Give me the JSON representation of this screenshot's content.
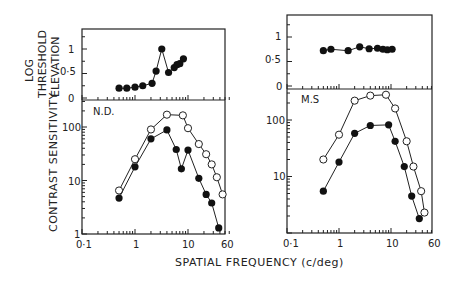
{
  "chart_data": [
    {
      "type": "line",
      "panel": "left-top",
      "subject": "N.D.",
      "ylabel": "LOG THRESHOLD ELEVATION",
      "yticks": [
        "0",
        "0·5",
        "1"
      ],
      "ylim": [
        0,
        1.3
      ],
      "xscale": "log",
      "xlim": [
        0.1,
        60
      ],
      "series": [
        {
          "name": "threshold elevation",
          "marker": "filled",
          "x": [
            0.5,
            0.7,
            1.0,
            1.4,
            2.1,
            2.5,
            3.2,
            4.3,
            5.5,
            6.2,
            7.0,
            8.2
          ],
          "y": [
            0.2,
            0.2,
            0.22,
            0.25,
            0.3,
            0.55,
            1.0,
            0.52,
            0.62,
            0.68,
            0.7,
            0.8
          ]
        }
      ]
    },
    {
      "type": "line",
      "panel": "left-bottom",
      "subject": "N.D.",
      "ylabel": "CONTRAST SENSITIVITY",
      "yscale": "log",
      "yticks": [
        "1",
        "10",
        "100"
      ],
      "ylim": [
        1,
        300
      ],
      "xscale": "log",
      "xticks": [
        "0·1",
        "1",
        "10",
        "60"
      ],
      "xlim": [
        0.1,
        60
      ],
      "series": [
        {
          "name": "open",
          "marker": "open",
          "x": [
            0.5,
            1,
            2,
            4,
            8,
            10,
            16,
            22,
            28,
            35,
            45
          ],
          "y": [
            6.5,
            25,
            90,
            170,
            165,
            95,
            48,
            31,
            20,
            11.5,
            5.5
          ]
        },
        {
          "name": "filled",
          "marker": "filled",
          "x": [
            0.5,
            1,
            2,
            4,
            6,
            7.5,
            10,
            16,
            22,
            28,
            38
          ],
          "y": [
            4.7,
            18,
            60,
            88,
            38,
            16.5,
            37,
            11,
            5.5,
            3.8,
            1.3
          ]
        }
      ]
    },
    {
      "type": "line",
      "panel": "right-top",
      "subject": "M.S",
      "yticks": [
        "0",
        "0·5",
        "1"
      ],
      "ylim": [
        0,
        1.3
      ],
      "xscale": "log",
      "xlim": [
        0.1,
        60
      ],
      "series": [
        {
          "name": "threshold elevation",
          "marker": "filled",
          "x": [
            0.5,
            0.7,
            1.5,
            2.5,
            3.8,
            5.5,
            7.0,
            8.5,
            10.5
          ],
          "y": [
            0.72,
            0.75,
            0.72,
            0.8,
            0.76,
            0.77,
            0.75,
            0.74,
            0.75
          ]
        }
      ]
    },
    {
      "type": "line",
      "panel": "right-bottom",
      "subject": "M.S",
      "yscale": "log",
      "yticks": [
        "10",
        "100"
      ],
      "ylim": [
        1,
        300
      ],
      "xscale": "log",
      "xticks": [
        "0·1",
        "1",
        "10",
        "60"
      ],
      "xlim": [
        0.1,
        60
      ],
      "series": [
        {
          "name": "open",
          "marker": "open",
          "x": [
            0.5,
            1,
            2,
            4,
            8,
            12,
            20,
            27,
            38,
            44
          ],
          "y": [
            20,
            55,
            220,
            270,
            280,
            160,
            42,
            15,
            5.5,
            2.3
          ]
        },
        {
          "name": "filled",
          "marker": "filled",
          "x": [
            0.5,
            1,
            2,
            4,
            9,
            12,
            18,
            25,
            35
          ],
          "y": [
            5.5,
            18,
            58,
            80,
            82,
            42,
            15,
            4.5,
            1.8
          ]
        }
      ]
    }
  ],
  "labels": {
    "ylabel_top_line1": "LOG",
    "ylabel_top_line2": "THRESHOLD",
    "ylabel_top_line3": "ELEVATION",
    "ylabel_bottom": "CONTRAST  SENSITIVITY",
    "xlabel": "SPATIAL   FREQUENCY  (c/deg)",
    "left_subject": "N.D.",
    "right_subject": "M.S",
    "left_top_ticks": [
      "1",
      "0·5",
      "0"
    ],
    "left_bottom_ticks": [
      "100",
      "10",
      "1"
    ],
    "right_top_ticks": [
      "1",
      "0·5",
      "0"
    ],
    "right_bottom_ticks": [
      "100",
      "10"
    ],
    "x_ticks": [
      "0·1",
      "1",
      "10",
      "60"
    ]
  }
}
